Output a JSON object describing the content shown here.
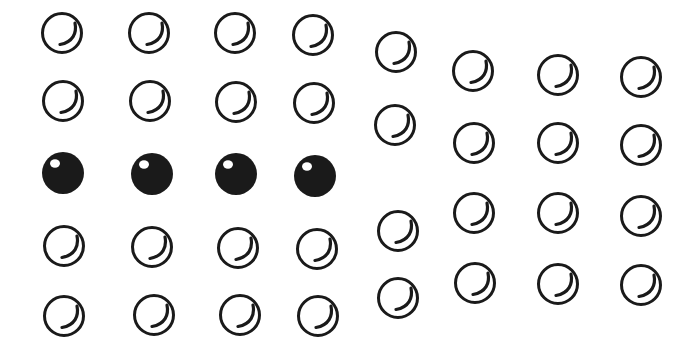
{
  "figure": {
    "background": "#ffffff",
    "ink_color": "#1a1a1a",
    "groups": [
      {
        "name": "left-grid",
        "rows": 5,
        "cols": 4,
        "dots": [
          {
            "x": 62,
            "y": 33,
            "type": "hollow"
          },
          {
            "x": 149,
            "y": 33,
            "type": "hollow"
          },
          {
            "x": 235,
            "y": 33,
            "type": "hollow"
          },
          {
            "x": 313,
            "y": 35,
            "type": "hollow"
          },
          {
            "x": 63,
            "y": 101,
            "type": "hollow"
          },
          {
            "x": 150,
            "y": 101,
            "type": "hollow"
          },
          {
            "x": 236,
            "y": 102,
            "type": "hollow"
          },
          {
            "x": 314,
            "y": 103,
            "type": "hollow"
          },
          {
            "x": 63,
            "y": 173,
            "type": "filled"
          },
          {
            "x": 152,
            "y": 174,
            "type": "filled"
          },
          {
            "x": 236,
            "y": 174,
            "type": "filled"
          },
          {
            "x": 315,
            "y": 176,
            "type": "filled"
          },
          {
            "x": 64,
            "y": 246,
            "type": "hollow"
          },
          {
            "x": 152,
            "y": 247,
            "type": "hollow"
          },
          {
            "x": 238,
            "y": 248,
            "type": "hollow"
          },
          {
            "x": 317,
            "y": 249,
            "type": "hollow"
          },
          {
            "x": 64,
            "y": 316,
            "type": "hollow"
          },
          {
            "x": 154,
            "y": 315,
            "type": "hollow"
          },
          {
            "x": 240,
            "y": 315,
            "type": "hollow"
          },
          {
            "x": 318,
            "y": 316,
            "type": "hollow"
          }
        ]
      },
      {
        "name": "right-grid",
        "rows": 4,
        "cols": 4,
        "dots": [
          {
            "x": 396,
            "y": 52,
            "type": "hollow"
          },
          {
            "x": 473,
            "y": 71,
            "type": "hollow"
          },
          {
            "x": 558,
            "y": 75,
            "type": "hollow"
          },
          {
            "x": 641,
            "y": 77,
            "type": "hollow"
          },
          {
            "x": 395,
            "y": 125,
            "type": "hollow"
          },
          {
            "x": 474,
            "y": 143,
            "type": "hollow"
          },
          {
            "x": 558,
            "y": 143,
            "type": "hollow"
          },
          {
            "x": 641,
            "y": 145,
            "type": "hollow"
          },
          {
            "x": 398,
            "y": 231,
            "type": "hollow"
          },
          {
            "x": 474,
            "y": 213,
            "type": "hollow"
          },
          {
            "x": 558,
            "y": 213,
            "type": "hollow"
          },
          {
            "x": 641,
            "y": 216,
            "type": "hollow"
          },
          {
            "x": 398,
            "y": 298,
            "type": "hollow"
          },
          {
            "x": 475,
            "y": 283,
            "type": "hollow"
          },
          {
            "x": 558,
            "y": 284,
            "type": "hollow"
          },
          {
            "x": 641,
            "y": 285,
            "type": "hollow"
          }
        ]
      }
    ]
  }
}
